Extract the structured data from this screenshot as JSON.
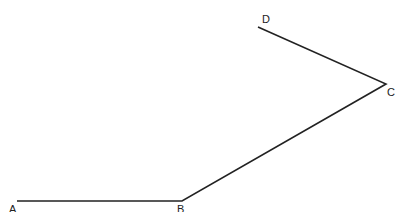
{
  "diagram": {
    "type": "polyline",
    "stroke_color": "#222222",
    "points": [
      {
        "label": "A",
        "x": 17,
        "y": 201,
        "label_x": 9,
        "label_y": 204
      },
      {
        "label": "B",
        "x": 182,
        "y": 201,
        "label_x": 177,
        "label_y": 204
      },
      {
        "label": "C",
        "x": 386,
        "y": 84,
        "label_x": 387,
        "label_y": 87
      },
      {
        "label": "D",
        "x": 258,
        "y": 27,
        "label_x": 262,
        "label_y": 14
      }
    ]
  }
}
